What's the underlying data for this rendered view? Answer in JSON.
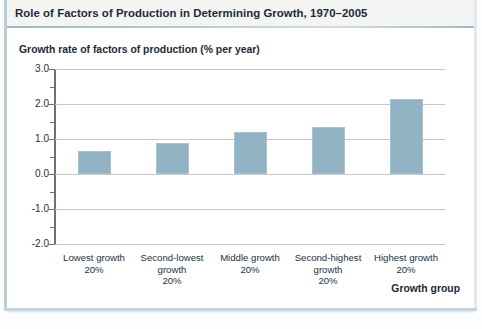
{
  "figure": {
    "title": "Role of Factors of Production in Determining Growth, 1970–2005"
  },
  "chart_data": {
    "type": "bar",
    "title": "Role of Factors of Production in Determining Growth, 1970–2005",
    "ylabel": "Growth rate of factors of production (% per year)",
    "xlabel": "Growth group",
    "categories": [
      "Lowest growth\n20%",
      "Second-lowest\ngrowth\n20%",
      "Middle growth\n20%",
      "Second-highest\ngrowth\n20%",
      "Highest growth\n20%"
    ],
    "category_lines": [
      [
        "Lowest growth",
        "20%"
      ],
      [
        "Second-lowest",
        "growth",
        "20%"
      ],
      [
        "Middle growth",
        "20%"
      ],
      [
        "Second-highest",
        "growth",
        "20%"
      ],
      [
        "Highest growth",
        "20%"
      ]
    ],
    "values": [
      0.66,
      0.9,
      1.2,
      1.35,
      2.15
    ],
    "ylim": [
      -2.0,
      3.0
    ],
    "ytick_labels": [
      "3.0",
      "2.0",
      "1.0",
      "0.0",
      "-1.0",
      "-2.0"
    ],
    "ytick_values": [
      3.0,
      2.0,
      1.0,
      0.0,
      -1.0,
      -2.0
    ],
    "yminor_ticks": [
      2.5,
      1.5,
      0.5,
      -0.5,
      -1.5
    ],
    "grid": true,
    "legend": null,
    "bar_color": "#92b3c4",
    "grid_color": "#c6c8c8",
    "axis_color": "#6e7072",
    "title_color": "#1c2a38"
  }
}
